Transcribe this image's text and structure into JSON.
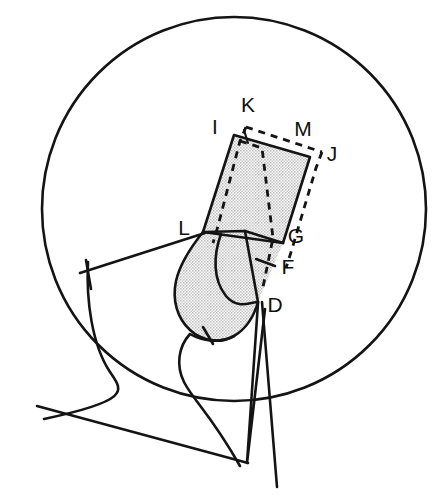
{
  "figure": {
    "background_color": "#ffffff",
    "line_color": "#141414",
    "shade_color": "#d9d9d9",
    "canvas": {
      "width": 446,
      "height": 501
    }
  },
  "circle": {
    "name": "boundary-circle",
    "center_x": 234,
    "center_y": 209,
    "radius": 192,
    "style": "solid"
  },
  "labels": [
    {
      "id": "K",
      "text": "K",
      "x": 248,
      "y": 112
    },
    {
      "id": "I",
      "text": "I",
      "x": 215,
      "y": 134
    },
    {
      "id": "M",
      "text": "M",
      "x": 303,
      "y": 136
    },
    {
      "id": "J",
      "text": "J",
      "x": 330,
      "y": 161
    },
    {
      "id": "L",
      "text": "L",
      "x": 181,
      "y": 235
    },
    {
      "id": "G",
      "text": "G",
      "x": 292,
      "y": 243
    },
    {
      "id": "F",
      "text": "F",
      "x": 284,
      "y": 273
    },
    {
      "id": "D",
      "text": "D",
      "x": 270,
      "y": 310
    }
  ],
  "shapes": {
    "solid_quad": {
      "name": "solid-shaded-quadrilateral",
      "vertices": [
        {
          "id": "I",
          "x": 234,
          "y": 135
        },
        {
          "id": "M",
          "x": 310,
          "y": 157
        },
        {
          "id": "G",
          "x": 283,
          "y": 243
        },
        {
          "id": "L",
          "x": 203,
          "y": 232
        }
      ],
      "fill": "halftone-gray",
      "stroke": "solid"
    },
    "dashed_quad": {
      "name": "dashed-offset-quadrilateral",
      "vertices": [
        {
          "id": "K",
          "x": 249,
          "y": 128
        },
        {
          "id": "J",
          "x": 320,
          "y": 153
        },
        {
          "id": "D",
          "x": 258,
          "y": 302
        },
        {
          "id": "inner",
          "x": 239,
          "y": 142
        }
      ],
      "stroke": "dashed"
    },
    "blob": {
      "name": "shaded-lobe-region",
      "description": "rounded teardrop lobe below the quadrilateral, shaded"
    },
    "wedge": {
      "name": "narrow-wedge-below-d",
      "description": "thin elongated V shape descending from point D"
    }
  },
  "tick_marks": [
    {
      "name": "tick-on-f-line",
      "x": 265,
      "y": 262
    },
    {
      "name": "tick-on-lobe-base",
      "x": 208,
      "y": 334
    },
    {
      "name": "tick-on-left-line",
      "x": 86,
      "y": 266
    }
  ],
  "lines": [
    {
      "name": "line-l-to-left",
      "from_x": 203,
      "from_y": 232,
      "to_x": 80,
      "to_y": 272
    },
    {
      "name": "line-d-down-left",
      "from_x": 258,
      "from_y": 302,
      "to_x": 228,
      "to_y": 469
    },
    {
      "name": "line-d-down-right",
      "from_x": 262,
      "from_y": 303,
      "to_x": 274,
      "to_y": 487
    },
    {
      "name": "curve-left-tail",
      "description": "s-curve exiting lower-left of circle"
    }
  ]
}
